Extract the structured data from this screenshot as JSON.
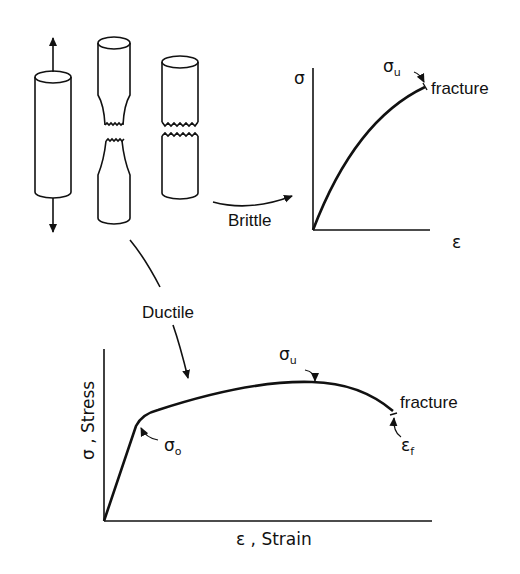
{
  "specimens": {
    "labels": [
      "intact specimen under tension",
      "ductile fracture (necked)",
      "brittle fracture"
    ]
  },
  "arrows": {
    "brittle_label": "Brittle",
    "ductile_label": "Ductile"
  },
  "brittle_chart": {
    "y_axis": "σ",
    "x_axis": "ε",
    "ultimate_symbol": "σ",
    "ultimate_sub": "u",
    "fracture_label": "fracture"
  },
  "ductile_chart": {
    "y_axis": "σ , Stress",
    "x_axis": "ε , Strain",
    "yield_symbol": "σ",
    "yield_sub": "o",
    "ultimate_symbol": "σ",
    "ultimate_sub": "u",
    "fracture_label": "fracture",
    "fracture_strain_symbol": "ε",
    "fracture_strain_sub": "f"
  }
}
